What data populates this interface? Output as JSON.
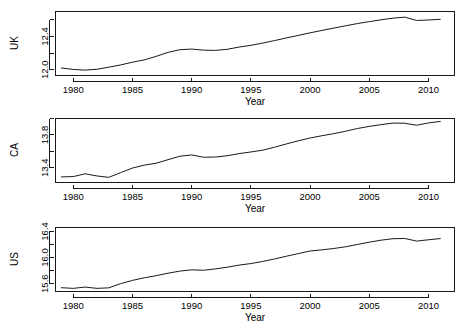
{
  "chart_data": [
    {
      "type": "line",
      "title": "",
      "panel_label": "UK",
      "xlabel": "Year",
      "ylabel": "UK",
      "xlim": [
        1978.5,
        2012.2
      ],
      "ylim": [
        11.93,
        12.7
      ],
      "xticks": [
        1980,
        1985,
        1990,
        1995,
        2000,
        2005,
        2010
      ],
      "xticklabels": [
        "1980",
        "1985",
        "1990",
        "1995",
        "2000",
        "2005",
        "2010"
      ],
      "yticks": [
        12.0,
        12.2,
        12.4,
        12.6
      ],
      "yticklabels": [
        "12.0",
        "",
        "12.4",
        ""
      ],
      "grid": false,
      "legend": "none",
      "x": [
        1979,
        1980,
        1981,
        1982,
        1983,
        1984,
        1985,
        1986,
        1987,
        1988,
        1989,
        1990,
        1991,
        1992,
        1993,
        1994,
        1995,
        1996,
        1997,
        1998,
        1999,
        2000,
        2001,
        2002,
        2003,
        2004,
        2005,
        2006,
        2007,
        2008,
        2009,
        2010,
        2011
      ],
      "values": [
        12.02,
        12.003,
        11.995,
        12.005,
        12.03,
        12.057,
        12.09,
        12.118,
        12.16,
        12.208,
        12.24,
        12.248,
        12.235,
        12.232,
        12.245,
        12.272,
        12.293,
        12.32,
        12.35,
        12.382,
        12.412,
        12.443,
        12.472,
        12.5,
        12.528,
        12.555,
        12.578,
        12.6,
        12.62,
        12.632,
        12.592,
        12.598,
        12.606
      ]
    },
    {
      "type": "line",
      "title": "",
      "panel_label": "CA",
      "xlabel": "Year",
      "ylabel": "CA",
      "xlim": [
        1978.5,
        2012.2
      ],
      "ylim": [
        13.22,
        14.0
      ],
      "xticks": [
        1980,
        1985,
        1990,
        1995,
        2000,
        2005,
        2010
      ],
      "xticklabels": [
        "1980",
        "1985",
        "1990",
        "1995",
        "2000",
        "2005",
        "2010"
      ],
      "yticks": [
        13.4,
        13.6,
        13.8,
        14.0
      ],
      "yticklabels": [
        "13.4",
        "",
        "13.8",
        ""
      ],
      "grid": false,
      "legend": "none",
      "x": [
        1979,
        1980,
        1981,
        1982,
        1983,
        1984,
        1985,
        1986,
        1987,
        1988,
        1989,
        1990,
        1991,
        1992,
        1993,
        1994,
        1995,
        1996,
        1997,
        1998,
        1999,
        2000,
        2001,
        2002,
        2003,
        2004,
        2005,
        2006,
        2007,
        2008,
        2009,
        2010,
        2011
      ],
      "values": [
        13.288,
        13.292,
        13.326,
        13.3,
        13.283,
        13.34,
        13.396,
        13.432,
        13.455,
        13.498,
        13.54,
        13.556,
        13.528,
        13.53,
        13.546,
        13.572,
        13.592,
        13.614,
        13.65,
        13.69,
        13.728,
        13.762,
        13.79,
        13.815,
        13.845,
        13.878,
        13.904,
        13.925,
        13.944,
        13.942,
        13.918,
        13.946,
        13.964
      ]
    },
    {
      "type": "line",
      "title": "",
      "panel_label": "US",
      "xlabel": "Year",
      "ylabel": "US",
      "xlim": [
        1978.5,
        2012.2
      ],
      "ylim": [
        15.48,
        16.46
      ],
      "xticks": [
        1980,
        1985,
        1990,
        1995,
        2000,
        2005,
        2010
      ],
      "xticklabels": [
        "1980",
        "1985",
        "1990",
        "1995",
        "2000",
        "2005",
        "2010"
      ],
      "yticks": [
        15.6,
        15.8,
        16.0,
        16.2,
        16.4
      ],
      "yticklabels": [
        "15.6",
        "",
        "16.0",
        "",
        "16.4"
      ],
      "grid": false,
      "legend": "none",
      "x": [
        1979,
        1980,
        1981,
        1982,
        1983,
        1984,
        1985,
        1986,
        1987,
        1988,
        1989,
        1990,
        1991,
        1992,
        1993,
        1994,
        1995,
        1996,
        1997,
        1998,
        1999,
        2000,
        2001,
        2002,
        2003,
        2004,
        2005,
        2006,
        2007,
        2008,
        2009,
        2010,
        2011
      ],
      "values": [
        15.538,
        15.528,
        15.548,
        15.528,
        15.536,
        15.6,
        15.65,
        15.69,
        15.722,
        15.76,
        15.792,
        15.812,
        15.805,
        15.826,
        15.852,
        15.884,
        15.908,
        15.94,
        15.978,
        16.02,
        16.06,
        16.1,
        16.118,
        16.138,
        16.165,
        16.2,
        16.235,
        16.266,
        16.288,
        16.292,
        16.252,
        16.272,
        16.29
      ]
    }
  ],
  "axis_titles": {
    "year": "Year"
  }
}
